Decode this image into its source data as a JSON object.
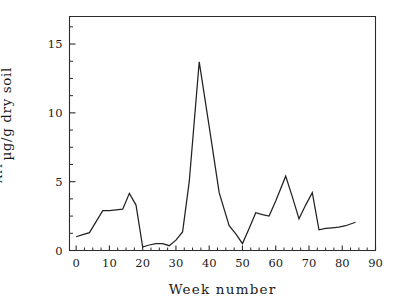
{
  "figure": {
    "background_color": "#ffffff",
    "line_color": "#222222",
    "axis_color": "#2b2b2b"
  },
  "chart_data": {
    "type": "line",
    "title": "",
    "subtitle": "",
    "xlabel": "Week number",
    "ylabel": "µg/g dry soil",
    "ylabel_superscript": "ATP",
    "ylabel_full": "µg ATP/g dry soil",
    "xlim": [
      -2,
      90
    ],
    "ylim": [
      0,
      17
    ],
    "xticks": [
      0,
      10,
      20,
      30,
      40,
      50,
      60,
      70,
      80,
      90
    ],
    "xtick_labels": [
      "0",
      "10",
      "20",
      "30",
      "40",
      "50",
      "60",
      "70",
      "80",
      "90"
    ],
    "x_minor_tick_step": 2.5,
    "yticks": [
      0,
      5,
      10,
      15
    ],
    "ytick_labels": [
      "0",
      "5",
      "10",
      "15"
    ],
    "y_minor_tick_step": 1.25,
    "grid": false,
    "legend": false,
    "legend_position": "none",
    "series": [
      {
        "name": "ATP",
        "x": [
          0,
          2,
          4,
          6,
          8,
          10,
          12,
          14,
          16,
          18,
          20,
          22,
          24,
          26,
          28,
          30,
          32,
          34,
          37,
          40,
          43,
          46,
          48,
          50,
          52,
          54,
          56,
          58,
          60,
          63,
          65,
          67,
          69,
          71,
          73,
          75,
          77,
          79,
          81,
          84
        ],
        "y": [
          1.0,
          1.15,
          1.3,
          2.1,
          2.9,
          2.9,
          2.95,
          3.0,
          4.15,
          3.3,
          0.25,
          0.4,
          0.5,
          0.5,
          0.35,
          0.75,
          1.35,
          5.0,
          13.7,
          9.0,
          4.2,
          1.8,
          1.2,
          0.5,
          1.6,
          2.75,
          2.6,
          2.5,
          3.6,
          5.4,
          3.9,
          2.3,
          3.3,
          4.2,
          1.5,
          1.6,
          1.65,
          1.7,
          1.8,
          2.05
        ]
      }
    ]
  }
}
